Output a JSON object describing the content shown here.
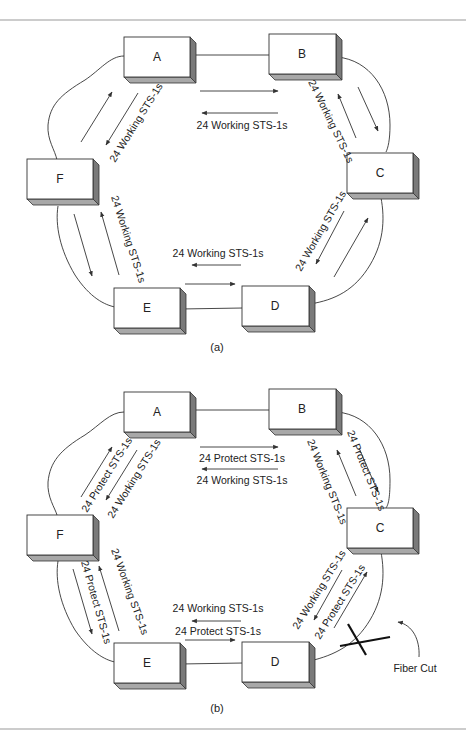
{
  "diagram": {
    "panel_a": {
      "caption": "(a)",
      "nodes": [
        "A",
        "B",
        "C",
        "D",
        "E",
        "F"
      ],
      "labels": {
        "ab_bottom": "24 Working STS-1s",
        "bc": "24 Working STS-1s",
        "cd": "24 Working STS-1s",
        "de": "24 Working STS-1s",
        "ef": "24 Working STS-1s",
        "fa": "24 Working STS-1s"
      }
    },
    "panel_b": {
      "caption": "(b)",
      "nodes": [
        "A",
        "B",
        "C",
        "D",
        "E",
        "F"
      ],
      "labels": {
        "ab_top": "24 Protect STS-1s",
        "ab_bottom": "24 Working STS-1s",
        "bc_working": "24 Working STS-1s",
        "bc_protect": "24 Protect STS-1s",
        "cd_working": "24 Working STS-1s",
        "cd_protect": "24 Protect STS-1s",
        "de_working": "24 Working STS-1s",
        "de_protect": "24 Protect STS-1s",
        "ef_working": "24 Working STS-1s",
        "ef_protect": "24 Protect STS-1s",
        "fa_protect": "24 Protect STS-1s",
        "fa_working": "24 Working STS-1s"
      },
      "fiber_cut_label": "Fiber Cut"
    },
    "colors": {
      "line": "#333333",
      "box_side": "#7a7a7a",
      "box_bottom": "#a8a8a8",
      "rule": "#999999"
    }
  }
}
